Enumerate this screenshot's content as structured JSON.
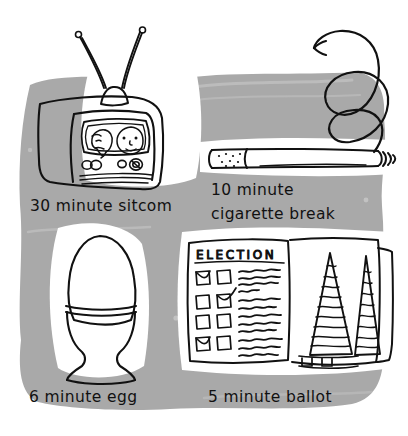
{
  "illustration": {
    "title": "Things that take a few minutes",
    "background_color": "#a9a9a9",
    "paper_color": "#ffffff",
    "ink_color": "#111111",
    "width": 408,
    "height": 436,
    "panels": [
      {
        "id": "sitcom",
        "subject": "television-set",
        "caption": "30 minute sitcom",
        "minutes": "30",
        "unit": "minute",
        "thing": "sitcom",
        "caption_lines": [
          "30 minute sitcom"
        ],
        "details": {
          "antenna": "rabbit-ear-antenna",
          "screen_content": "two faces",
          "knobs": "4",
          "grille_lines": "3"
        }
      },
      {
        "id": "cigarette",
        "subject": "lit-cigarette",
        "caption": "10 minute cigarette break",
        "minutes": "10",
        "unit": "minute",
        "thing": "cigarette break",
        "caption_lines": [
          "10 minute",
          "cigarette break"
        ],
        "details": {
          "smoke": "curling-spiral",
          "filter": "dotted",
          "ember": "lit-tip"
        }
      },
      {
        "id": "egg",
        "subject": "soft-boiled-egg-in-cup",
        "caption": "6 minute egg",
        "minutes": "6",
        "unit": "minute",
        "thing": "egg",
        "caption_lines": [
          "6 minute egg"
        ],
        "details": {
          "cup": "pedestal-egg-cup",
          "rim": "double-line"
        }
      },
      {
        "id": "ballot",
        "subject": "election-ballot-and-voting-booths",
        "caption": "5 minute ballot",
        "minutes": "5",
        "unit": "minute",
        "thing": "ballot",
        "caption_lines": [
          "5 minute ballot"
        ],
        "ballot_header": "ELECTION",
        "details": {
          "checkbox_rows": "4",
          "checkboxes_per_row": "2",
          "checked_marks": "3",
          "booth_curtains": "2"
        }
      }
    ]
  }
}
